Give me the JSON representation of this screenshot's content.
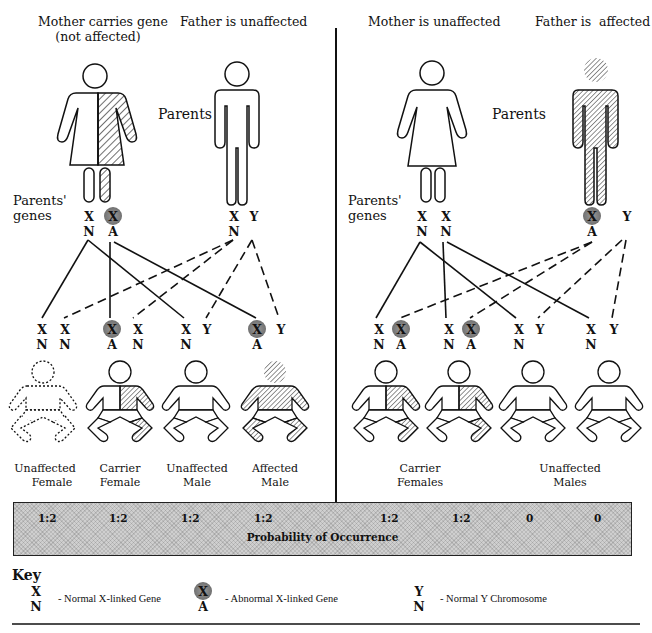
{
  "left_panel": {
    "mother_title_line1": "Mother carries gene",
    "mother_title_line2": "(not affected)",
    "father_title": "Father is unaffected",
    "parents_label": "Parents",
    "genes_label_line1": "Parents'",
    "genes_label_line2": "genes",
    "mother_genes": [
      {
        "top": "X",
        "bottom": "N",
        "abnormal": false
      },
      {
        "top": "X",
        "bottom": "A",
        "abnormal": true
      }
    ],
    "father_genes": [
      {
        "top": "X",
        "bottom": "N",
        "abnormal": false
      },
      {
        "top": "Y",
        "bottom": "",
        "abnormal": false
      }
    ],
    "children": [
      {
        "genes": [
          {
            "top": "X",
            "bottom": "N"
          },
          {
            "top": "X",
            "bottom": "N"
          }
        ],
        "caption_line1": "Unaffected",
        "caption_line2": "Female",
        "probability": "1:2"
      },
      {
        "genes": [
          {
            "top": "X",
            "bottom": "A",
            "abnormal": true
          },
          {
            "top": "X",
            "bottom": "N"
          }
        ],
        "caption_line1": "Carrier",
        "caption_line2": "Female",
        "probability": "1:2"
      },
      {
        "genes": [
          {
            "top": "X",
            "bottom": "N"
          },
          {
            "top": "Y",
            "bottom": ""
          }
        ],
        "caption_line1": "Unaffected",
        "caption_line2": "Male",
        "probability": "1:2"
      },
      {
        "genes": [
          {
            "top": "X",
            "bottom": "A",
            "abnormal": true
          },
          {
            "top": "Y",
            "bottom": ""
          }
        ],
        "caption_line1": "Affected",
        "caption_line2": "Male",
        "probability": "1:2"
      }
    ]
  },
  "right_panel": {
    "mother_title": "Mother is unaffected",
    "father_title": "Father is  affected",
    "parents_label": "Parents",
    "genes_label_line1": "Parents'",
    "genes_label_line2": "genes",
    "mother_genes": [
      {
        "top": "X",
        "bottom": "N",
        "abnormal": false
      },
      {
        "top": "X",
        "bottom": "N",
        "abnormal": false
      }
    ],
    "father_genes": [
      {
        "top": "X",
        "bottom": "A",
        "abnormal": true
      },
      {
        "top": "Y",
        "bottom": "",
        "abnormal": false
      }
    ],
    "children": [
      {
        "genes": [
          {
            "top": "X",
            "bottom": "N"
          },
          {
            "top": "X",
            "bottom": "A",
            "abnormal": true
          }
        ],
        "probability": "1:2"
      },
      {
        "genes": [
          {
            "top": "X",
            "bottom": "N"
          },
          {
            "top": "X",
            "bottom": "A",
            "abnormal": true
          }
        ],
        "probability": "1:2"
      },
      {
        "genes": [
          {
            "top": "X",
            "bottom": "N"
          },
          {
            "top": "Y",
            "bottom": ""
          }
        ],
        "probability": "0"
      },
      {
        "genes": [
          {
            "top": "X",
            "bottom": "N"
          },
          {
            "top": "Y",
            "bottom": ""
          }
        ],
        "probability": "0"
      }
    ],
    "group_captions": [
      {
        "line1": "Carrier",
        "line2": "Females"
      },
      {
        "line1": "Unaffected",
        "line2": "Males"
      }
    ]
  },
  "probability_bar": {
    "title": "Probability of Occurrence",
    "values": [
      "1:2",
      "1:2",
      "1:2",
      "1:2",
      "1:2",
      "1:2",
      "0",
      "0"
    ]
  },
  "key": {
    "title": "Key",
    "items": [
      {
        "symbol_top": "X",
        "symbol_bottom": "N",
        "abnormal": false,
        "description": "- Normal X-linked Gene"
      },
      {
        "symbol_top": "X",
        "symbol_bottom": "A",
        "abnormal": true,
        "description": "- Abnormal X-linked Gene"
      },
      {
        "symbol_top": "Y",
        "symbol_bottom": "N",
        "abnormal": false,
        "description": "- Normal Y Chromosome"
      }
    ]
  },
  "colors": {
    "ink": "#111111",
    "hatch": "#222222",
    "abnormal_gene_fill": "#808080",
    "probability_bar_fill": "#cfcfcf"
  }
}
